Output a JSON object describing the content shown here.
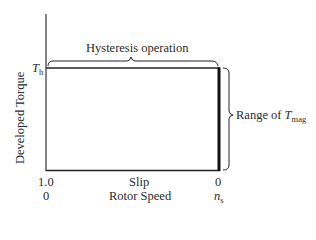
{
  "diagram": {
    "y_axis_label": "Developed Torque",
    "th_label": {
      "main": "T",
      "sub": "h"
    },
    "top_brace_label": "Hysteresis operation",
    "right_brace_label": {
      "prefix": "Range of ",
      "main": "T",
      "sub": "mag"
    },
    "x_axis": {
      "slip_label": "Slip",
      "speed_label": "Rotor Speed",
      "left_slip_tick": "1.0",
      "left_speed_tick": "0",
      "right_slip_tick": "0",
      "right_speed_tick": {
        "main": "n",
        "sub": "s"
      }
    },
    "colors": {
      "line": "#1a1a1a",
      "background": "#ffffff"
    }
  }
}
